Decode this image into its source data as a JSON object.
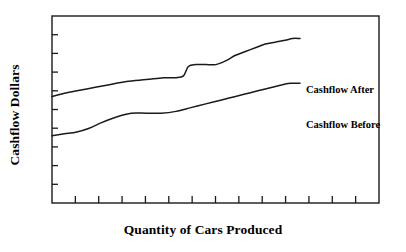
{
  "chart_data": {
    "type": "line",
    "title": "",
    "xlabel": "Quantity of Cars Produced",
    "ylabel": "Cashflow Dollars",
    "xlim": [
      0,
      100
    ],
    "ylim": [
      0,
      100
    ],
    "grid": false,
    "legend_position": "right-inline-labels",
    "x_tick_count": 13,
    "y_tick_count": 9,
    "x_tick_labels": [],
    "y_tick_labels": [],
    "annotations": [
      {
        "text": "Step increase in cashflow after improvement",
        "series": "Cashflow After",
        "x": 54
      }
    ],
    "series": [
      {
        "name": "Cashflow After",
        "label": "Cashflow After",
        "color": "#1a1a1a",
        "x": [
          0,
          6,
          14,
          22,
          30,
          38,
          45,
          50,
          53,
          55,
          58,
          62,
          66,
          70,
          74,
          78,
          82,
          86,
          90,
          94,
          97,
          100
        ],
        "values": [
          57,
          59,
          61,
          63,
          65,
          66,
          67,
          67,
          68,
          73,
          74,
          74,
          74,
          76,
          79,
          81,
          83,
          85,
          86,
          87,
          88,
          88
        ]
      },
      {
        "name": "Cashflow Before",
        "label": "Cashflow Before",
        "color": "#1a1a1a",
        "x": [
          0,
          5,
          10,
          15,
          20,
          26,
          32,
          38,
          44,
          50,
          56,
          62,
          68,
          74,
          80,
          86,
          92,
          96,
          100
        ],
        "values": [
          36,
          37,
          38,
          40,
          43,
          46,
          48,
          48,
          48,
          49,
          51,
          53,
          55,
          57,
          59,
          61,
          63,
          64,
          64
        ]
      }
    ]
  },
  "labels": {
    "y_axis_title": "Cashflow Dollars",
    "x_axis_title": "Quantity of Cars Produced",
    "series_after": "Cashflow After",
    "series_before": "Cashflow Before"
  },
  "style": {
    "axis_color": "#1a1a1a",
    "line_color": "#1a1a1a",
    "background": "#ffffff"
  },
  "geometry": {
    "plot_left": 52,
    "plot_right": 379,
    "plot_top": 16,
    "plot_bottom": 203,
    "line_end_x": 300
  }
}
